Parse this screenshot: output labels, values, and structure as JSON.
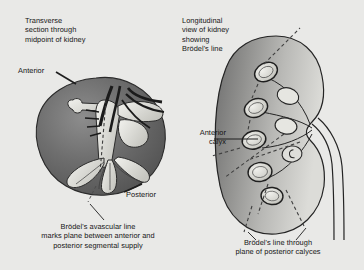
{
  "figure": {
    "background_color": "#e9e9e7",
    "width": 364,
    "height": 270
  },
  "panels": {
    "left": {
      "heading": "Transverse\nsection through\nmidpoint of kidney",
      "labels": {
        "anterior": "Anterior",
        "posterior": "Posterior"
      },
      "caption": "Brödel's avascular line\nmarks plane between anterior and\nposterior segmental supply",
      "anatomy": {
        "outline_name": "kidney-transverse-section",
        "fill_color": "#6f6f6f",
        "highlight_color": "#d9d9d4",
        "vessel_color": "#222222",
        "brodel_line_style": "dashed"
      }
    },
    "right": {
      "heading": "Longitudinal\nview of kidney\nshowing\nBrödel's line",
      "labels": {
        "anterior_calyx": "Anterior\ncalyx"
      },
      "caption": "Brödel's line through\nplane of posterior calyces",
      "anatomy": {
        "outline_name": "kidney-longitudinal-section",
        "fill_color": "#9a9a98",
        "highlight_color": "#e4e4e0",
        "calyx_count": 5,
        "brodel_line_style": "dashed"
      }
    }
  }
}
